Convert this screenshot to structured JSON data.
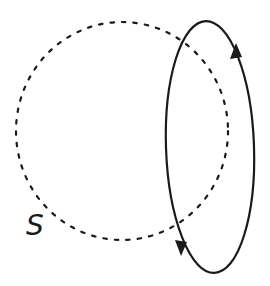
{
  "diagram": {
    "surface": {
      "label": "S",
      "style": "dashed",
      "shape": "circle",
      "center": [
        122,
        131
      ],
      "radius_x": 106,
      "radius_y": 109
    },
    "loop": {
      "style": "solid",
      "shape": "ellipse",
      "center": [
        210,
        147
      ],
      "radius_x": 44,
      "radius_y": 126,
      "orientation": "counterclockwise: up on right side, down on left side",
      "arrows": [
        {
          "position": "upper-right",
          "direction": "up"
        },
        {
          "position": "lower-left",
          "direction": "down"
        }
      ]
    },
    "colors": {
      "stroke": "#1a1a1a",
      "background": "#ffffff"
    }
  }
}
